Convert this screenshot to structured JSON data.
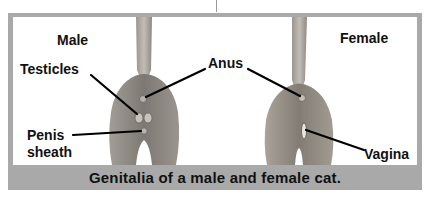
{
  "figure": {
    "caption": "Genitalia of a male and female cat.",
    "panels": [
      {
        "title": "Male",
        "labels": [
          {
            "id": "testicles",
            "text": "Testicles"
          },
          {
            "id": "penis_sheath_line1",
            "text": "Penis"
          },
          {
            "id": "penis_sheath_line2",
            "text": "sheath"
          }
        ]
      },
      {
        "title": "Female",
        "labels": [
          {
            "id": "vagina",
            "text": "Vagina"
          }
        ]
      }
    ],
    "shared_label": "Anus"
  },
  "colors": {
    "frame": "#a9a9a9",
    "panel_bg": "#ffffff",
    "fur": "#8a8580",
    "leader_line": "#000000"
  }
}
